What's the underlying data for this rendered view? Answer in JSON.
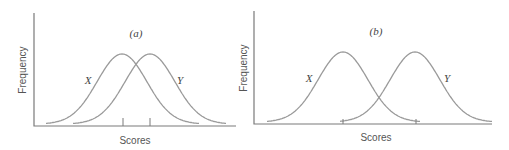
{
  "chart_data": [
    {
      "type": "line",
      "panel_label": "(a)",
      "title": "(a)",
      "xlabel": "Scores",
      "ylabel": "Frequency",
      "grid": false,
      "legend": "none (curves labeled inline)",
      "series": [
        {
          "name": "X",
          "distribution": "normal",
          "mean_x_px": 122,
          "peak_y_px": 56,
          "x_start_px": 46,
          "x_end_px": 199
        },
        {
          "name": "Y",
          "distribution": "normal",
          "mean_x_px": 150,
          "peak_y_px": 56,
          "x_start_px": 73,
          "x_end_px": 226
        }
      ],
      "mean_ticks_x_px": [
        123,
        150
      ],
      "note": "Two heavily overlapping normal distributions; means close together"
    },
    {
      "type": "line",
      "panel_label": "(b)",
      "title": "(b)",
      "xlabel": "Scores",
      "ylabel": "Frequency",
      "grid": false,
      "legend": "none (curves labeled inline)",
      "series": [
        {
          "name": "X",
          "distribution": "normal",
          "mean_x_px": 343,
          "peak_y_px": 54,
          "x_start_px": 267,
          "x_end_px": 420
        },
        {
          "name": "Y",
          "distribution": "normal",
          "mean_x_px": 415,
          "peak_y_px": 54,
          "x_start_px": 340,
          "x_end_px": 492
        }
      ],
      "mean_ticks_x_px": [
        343,
        416
      ],
      "note": "Two normal distributions with little overlap; means far apart"
    }
  ],
  "panels": {
    "a": {
      "title": "(a)",
      "ylabel": "Frequency",
      "xlabel": "Scores",
      "label_x": "X",
      "label_y": "Y"
    },
    "b": {
      "title": "(b)",
      "ylabel": "Frequency",
      "xlabel": "Scores",
      "label_x": "X",
      "label_y": "Y"
    }
  },
  "colors": {
    "axis": "#7a7a7a",
    "curve": "#9a9a9a",
    "text": "#555555"
  }
}
